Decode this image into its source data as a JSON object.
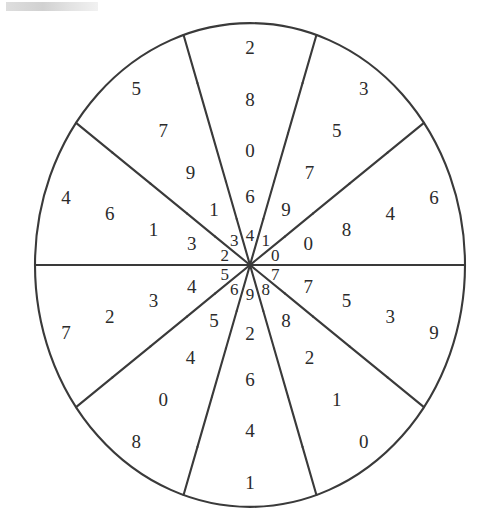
{
  "figure": {
    "title": "",
    "type": "radial-number-wheel",
    "center": {
      "x": 250,
      "y": 265
    },
    "ring_count": 5,
    "sectors_per_ring": 10,
    "stroke_color": "#3a3a3a",
    "text_color": "#2b2b2b",
    "background_color": "#ffffff"
  },
  "chart_data": {
    "type": "pie",
    "title": "",
    "xlabel": "",
    "ylabel": "",
    "legend": [],
    "grid": false,
    "rings": [
      {
        "index": 0,
        "name": "innermost-ring",
        "radius_inner": 0,
        "radius_outer": 43,
        "rotation_deg": -18,
        "values": [
          "4",
          "1",
          "0",
          "7",
          "8",
          "9",
          "6",
          "5",
          "2",
          "3"
        ]
      },
      {
        "index": 1,
        "name": "ring-2",
        "radius_inner": 43,
        "radius_outer": 78,
        "rotation_deg": -18,
        "values": [
          "6",
          "9",
          "0",
          "7",
          "8",
          "2",
          "5",
          "4",
          "3",
          "1"
        ]
      },
      {
        "index": 2,
        "name": "ring-3",
        "radius_inner": 78,
        "radius_outer": 123,
        "rotation_deg": -18,
        "values": [
          "0",
          "7",
          "8",
          "5",
          "2",
          "6",
          "4",
          "3",
          "1",
          "9"
        ]
      },
      {
        "index": 3,
        "name": "ring-4",
        "radius_inner": 123,
        "radius_outer": 170,
        "rotation_deg": -18,
        "values": [
          "8",
          "5",
          "4",
          "3",
          "1",
          "4",
          "0",
          "2",
          "6",
          "7"
        ]
      },
      {
        "index": 4,
        "name": "outer-ring",
        "radius_inner": 170,
        "radius_outer": 215,
        "rotation_deg": -18,
        "values": [
          "2",
          "3",
          "6",
          "9",
          "0",
          "1",
          "8",
          "7",
          "4",
          "5"
        ]
      }
    ]
  },
  "annotations": {
    "scan_artifact": "gray scanner smudge at top-left corner"
  }
}
